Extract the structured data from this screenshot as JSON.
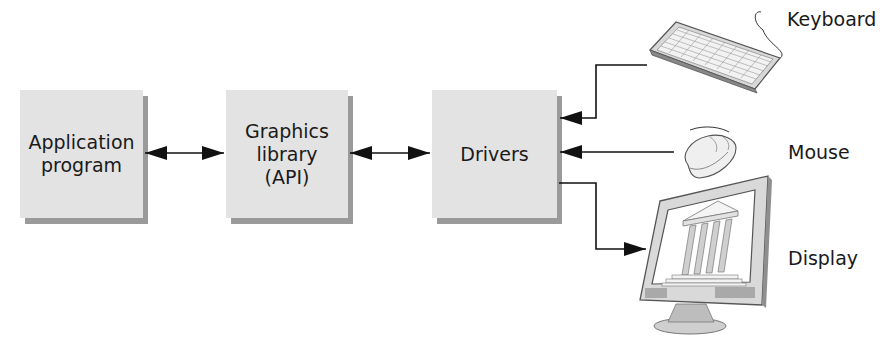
{
  "diagram": {
    "blocks": [
      {
        "id": "application",
        "lines": [
          "Application",
          "program"
        ]
      },
      {
        "id": "graphics-library",
        "lines": [
          "Graphics",
          "library",
          "(API)"
        ]
      },
      {
        "id": "drivers",
        "lines": [
          "Drivers"
        ]
      }
    ],
    "devices": [
      {
        "id": "keyboard",
        "label": "Keyboard",
        "direction": "input"
      },
      {
        "id": "mouse",
        "label": "Mouse",
        "direction": "input"
      },
      {
        "id": "display",
        "label": "Display",
        "direction": "output"
      }
    ],
    "connections": [
      {
        "from": "application",
        "to": "graphics-library",
        "type": "bidirectional"
      },
      {
        "from": "graphics-library",
        "to": "drivers",
        "type": "bidirectional"
      },
      {
        "from": "keyboard",
        "to": "drivers",
        "type": "directed"
      },
      {
        "from": "mouse",
        "to": "drivers",
        "type": "directed"
      },
      {
        "from": "drivers",
        "to": "display",
        "type": "directed"
      }
    ],
    "colors": {
      "box_fill": "#e3e3e3",
      "box_shadow": "#9a9a9a",
      "line": "#111111"
    }
  }
}
